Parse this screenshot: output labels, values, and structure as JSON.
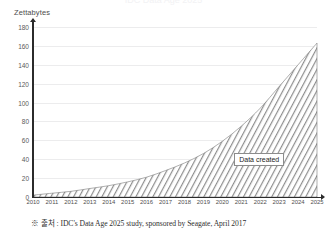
{
  "title_strip": "IDC Data Age 2025",
  "axis_title": "Zettabytes",
  "callout_label": "Data created",
  "footnote": "※ 출처 : IDC's Data Age 2025 study, sponsored by Seagate, April 2017",
  "colors": {
    "axis": "#2b2b2b",
    "gridline": "#ececed",
    "hatch": "#8e8e8e",
    "text": "#4f4f4f",
    "background": "#ffffff"
  },
  "chart_data": {
    "type": "area",
    "title": "",
    "xlabel": "",
    "ylabel": "Zettabytes",
    "ylim": [
      0,
      180
    ],
    "yticks": [
      0,
      20,
      40,
      60,
      80,
      100,
      120,
      140,
      160,
      180
    ],
    "grid": true,
    "legend": "none",
    "annotations": [
      {
        "text": "Data created",
        "x": 2022,
        "y": 40
      }
    ],
    "categories": [
      "2010",
      "2011",
      "2012",
      "2013",
      "2014",
      "2015",
      "2016",
      "2017",
      "2018",
      "2019",
      "2020",
      "2021",
      "2022",
      "2023",
      "2024",
      "2025"
    ],
    "series": [
      {
        "name": "Data created",
        "values": [
          2,
          4,
          6,
          9,
          12,
          16,
          21,
          28,
          36,
          46,
          59,
          75,
          94,
          117,
          140,
          163
        ]
      }
    ]
  }
}
